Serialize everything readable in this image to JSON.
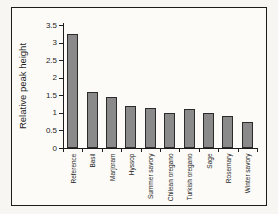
{
  "chart_data": {
    "type": "bar",
    "title": "",
    "xlabel": "",
    "ylabel": "Relative peak height",
    "categories": [
      "Reference",
      "Basil",
      "Marjoram",
      "Hyssop",
      "Summer savory",
      "Chilean oregano",
      "Turkish oregano",
      "Sage",
      "Rosemary",
      "Winter savory"
    ],
    "values": [
      3.25,
      1.6,
      1.45,
      1.2,
      1.15,
      1.0,
      1.1,
      1.0,
      0.9,
      0.75
    ],
    "ylim": [
      0,
      3.5
    ],
    "ytick_step": 0.5,
    "ytick_labels": [
      "0",
      "0.5",
      "1",
      "1.5",
      "2",
      "2.5",
      "3",
      "3.5"
    ],
    "grid": false,
    "legend": "none",
    "bar_color": "#8a8a8a",
    "bar_border_color": "#2b2b2b"
  },
  "colors": {
    "page_bg": "#f7f6f2",
    "figure_bg": "#fcfbf8",
    "frame_border": "#1c1c1c",
    "axis": "#1c1c1c",
    "text": "#1f1f1f"
  }
}
